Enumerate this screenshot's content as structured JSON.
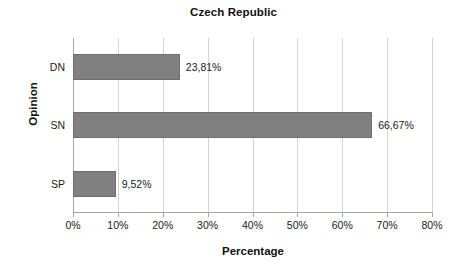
{
  "chart_data": {
    "type": "bar",
    "orientation": "horizontal",
    "title": "Czech Republic",
    "xlabel": "Percentage",
    "ylabel": "Opinion",
    "categories": [
      "DN",
      "SN",
      "SP"
    ],
    "values": [
      23.81,
      66.67,
      9.52
    ],
    "value_labels": [
      "23,81%",
      "66,67%",
      "9,52%"
    ],
    "xlim": [
      0,
      80
    ],
    "xticks": [
      0,
      10,
      20,
      30,
      40,
      50,
      60,
      70,
      80
    ],
    "xtick_labels": [
      "0%",
      "10%",
      "20%",
      "30%",
      "40%",
      "50%",
      "60%",
      "70%",
      "80%"
    ],
    "grid": "vertical",
    "legend": "none",
    "bar_color": "#808080",
    "bar_border_color": "#6e6e6e",
    "gridline_color": "#d3d3d3",
    "axis_color": "#a6a6a6",
    "background_color": "#ffffff",
    "text_color": "#1a1a1a"
  }
}
